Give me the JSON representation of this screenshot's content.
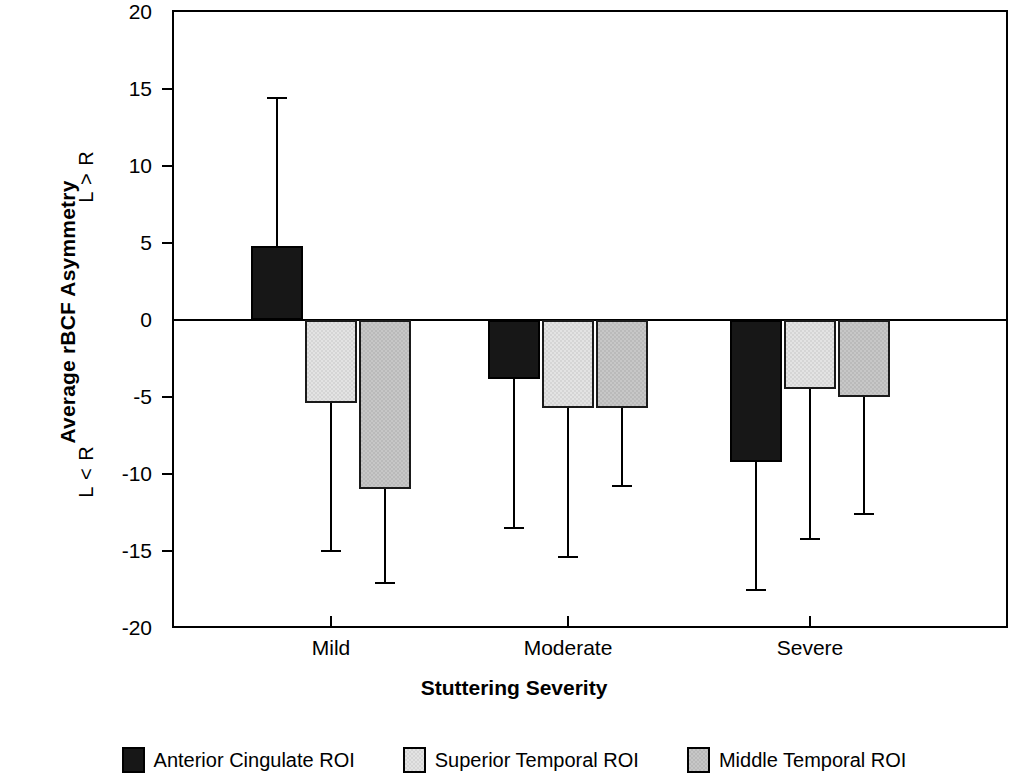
{
  "chart_data": {
    "type": "bar",
    "title": "",
    "xlabel": "Stuttering Severity",
    "ylabel": "Average rBCF Asymmetry",
    "categories": [
      "Mild",
      "Moderate",
      "Severe"
    ],
    "ylim": [
      -20,
      20
    ],
    "ytick_labels": [
      "20",
      "15",
      "10",
      "5",
      "0",
      "-5",
      "-10",
      "-15",
      "-20"
    ],
    "ytick_values": [
      20,
      15,
      10,
      5,
      0,
      -5,
      -10,
      -15,
      -20
    ],
    "grid": false,
    "legend_position": "bottom",
    "annotations": [
      "L > R",
      "L < R"
    ],
    "error_bars": "one-sided (away from zero)",
    "series": [
      {
        "name": "Anterior Cingulate ROI",
        "color": "#171717",
        "fill": "dark",
        "values": [
          4.8,
          -3.8,
          -9.2
        ],
        "error_ends": [
          14.4,
          -13.5,
          -17.5
        ]
      },
      {
        "name": "Superior Temporal ROI",
        "color": "#e3e3e3",
        "fill": "light",
        "values": [
          -5.4,
          -5.7,
          -4.5
        ],
        "error_ends": [
          -15.0,
          -15.4,
          -14.2
        ]
      },
      {
        "name": "Middle Temporal ROI",
        "color": "#c7c7c7",
        "fill": "medium",
        "values": [
          -11.0,
          -5.7,
          -5.0
        ],
        "error_ends": [
          -17.1,
          -10.8,
          -12.6
        ]
      }
    ]
  },
  "axis": {
    "y_title": "Average rBCF Asymmetry",
    "y_note_upper": "L > R",
    "y_note_lower": "L < R",
    "x_title": "Stuttering Severity"
  },
  "legend": {
    "items": [
      {
        "label": "Anterior Cingulate ROI",
        "fill": "dark"
      },
      {
        "label": "Superior Temporal ROI",
        "fill": "light"
      },
      {
        "label": "Middle Temporal ROI",
        "fill": "medium"
      }
    ]
  }
}
